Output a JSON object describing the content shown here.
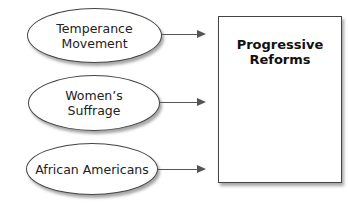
{
  "diagram": {
    "type": "concept-map",
    "inputs": [
      {
        "lines": [
          "Temperance",
          "Movement"
        ]
      },
      {
        "lines": [
          "Women’s",
          "Suffrage"
        ]
      },
      {
        "lines": [
          "African Americans"
        ]
      }
    ],
    "target": {
      "lines": [
        "Progressive",
        "Reforms"
      ]
    },
    "colors": {
      "stroke": "#444444",
      "text": "#222222",
      "background": "#ffffff"
    }
  }
}
